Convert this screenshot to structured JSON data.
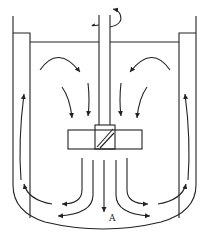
{
  "diagram": {
    "type": "stirred-tank-flow-pattern",
    "components": [
      "tank-wall",
      "baffles",
      "liquid-surface",
      "shaft",
      "impeller",
      "rotation-arrow",
      "flow-arrows"
    ],
    "labels": {
      "point_a": "A"
    },
    "colors": {
      "stroke": "#222222",
      "background": "#ffffff"
    }
  }
}
